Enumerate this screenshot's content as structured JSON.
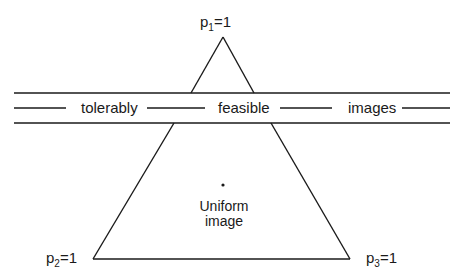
{
  "diagram": {
    "type": "simplex",
    "vertices": [
      {
        "name": "p",
        "sub": "1",
        "eq": "=1",
        "position": "top"
      },
      {
        "name": "p",
        "sub": "2",
        "eq": "=1",
        "position": "bottom-left"
      },
      {
        "name": "p",
        "sub": "3",
        "eq": "=1",
        "position": "bottom-right"
      }
    ],
    "band": {
      "words": [
        "tolerably",
        "feasible",
        "images"
      ]
    },
    "center": {
      "line1": "Uniform",
      "line2": "image"
    },
    "colors": {
      "stroke": "#1a1a1a",
      "background": "#ffffff"
    }
  }
}
